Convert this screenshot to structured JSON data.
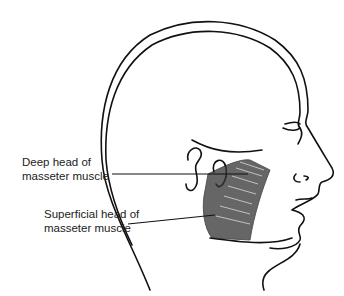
{
  "diagram": {
    "labels": [
      {
        "id": "deep",
        "line1": "Deep head of",
        "line2": "masseter muscle"
      },
      {
        "id": "superficial",
        "line1": "Superficial head of",
        "line2": "masseter muscle"
      }
    ],
    "colors": {
      "line": "#111111",
      "text": "#222222",
      "background": "#ffffff"
    }
  }
}
